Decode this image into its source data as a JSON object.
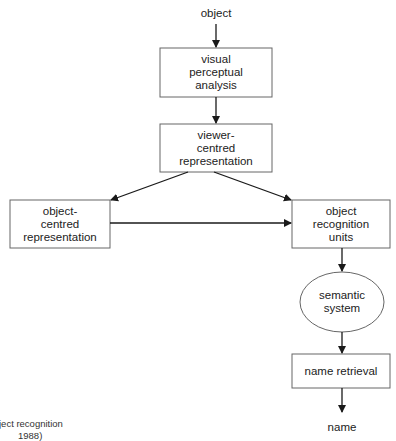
{
  "diagram": {
    "input_label": "object",
    "output_label": "name",
    "nodes": {
      "visual_perceptual_analysis": "visual\nperceptual\nanalysis",
      "viewer_centred_representation": "viewer-\ncentred\nrepresentation",
      "object_centred_representation": "object-\ncentred\nrepresentation",
      "object_recognition_units": "object\nrecognition\nunits",
      "semantic_system": "semantic\nsystem",
      "name_retrieval": "name retrieval"
    },
    "caption": {
      "line1": "ject recognition",
      "line2": "1988)"
    },
    "colors": {
      "stroke": "#555555",
      "arrow": "#1a1a1a",
      "text": "#222222"
    }
  }
}
